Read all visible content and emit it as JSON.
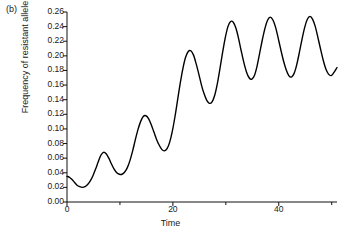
{
  "panel": {
    "label": "(b)"
  },
  "chart_data": {
    "type": "line",
    "title": "",
    "subtitle": "",
    "xlabel": "Time",
    "ylabel": "Frequency of resistant allele",
    "xlim": [
      0,
      51
    ],
    "ylim": [
      0.0,
      0.26
    ],
    "grid": false,
    "legend": null,
    "line_color": "#000000",
    "line_width": 1.4,
    "xticks": [
      0,
      20,
      40
    ],
    "xtick_labels": [
      "0",
      "20",
      "40"
    ],
    "xminor_ticks": [
      10,
      30,
      50
    ],
    "yticks": [
      0.0,
      0.02,
      0.04,
      0.06,
      0.08,
      0.1,
      0.12,
      0.14,
      0.16,
      0.18,
      0.2,
      0.22,
      0.24,
      0.26
    ],
    "ytick_labels": [
      "0.00",
      "0.02",
      "0.04",
      "0.06",
      "0.08",
      "0.10",
      "0.12",
      "0.14",
      "0.16",
      "0.18",
      "0.20",
      "0.22",
      "0.24",
      "0.26"
    ],
    "series": [
      {
        "name": "resistant allele frequency",
        "x": [
          0.0,
          0.4,
          0.9,
          1.4,
          1.9,
          2.4,
          2.9,
          3.4,
          3.9,
          4.4,
          4.9,
          5.4,
          5.9,
          6.4,
          6.9,
          7.4,
          7.9,
          8.4,
          8.9,
          9.4,
          9.9,
          10.4,
          10.9,
          11.4,
          11.9,
          12.4,
          12.9,
          13.4,
          13.9,
          14.4,
          14.9,
          15.4,
          15.9,
          16.4,
          16.9,
          17.4,
          17.9,
          18.4,
          18.9,
          19.4,
          19.9,
          20.4,
          20.9,
          21.4,
          21.9,
          22.4,
          22.9,
          23.4,
          23.9,
          24.4,
          24.9,
          25.4,
          25.9,
          26.4,
          26.9,
          27.4,
          27.9,
          28.4,
          28.9,
          29.4,
          29.9,
          30.4,
          30.9,
          31.4,
          31.9,
          32.4,
          32.9,
          33.4,
          33.9,
          34.4,
          34.9,
          35.4,
          35.9,
          36.4,
          36.9,
          37.4,
          37.9,
          38.4,
          38.9,
          39.4,
          39.9,
          40.4,
          40.9,
          41.4,
          41.9,
          42.4,
          42.9,
          43.4,
          43.9,
          44.4,
          44.9,
          45.4,
          45.9,
          46.4,
          46.9,
          47.4,
          47.9,
          48.4,
          48.9,
          49.4,
          49.9,
          50.4,
          51.0
        ],
        "y": [
          0.035,
          0.034,
          0.031,
          0.027,
          0.023,
          0.021,
          0.02,
          0.021,
          0.024,
          0.029,
          0.036,
          0.045,
          0.055,
          0.064,
          0.068,
          0.066,
          0.06,
          0.052,
          0.045,
          0.04,
          0.038,
          0.038,
          0.041,
          0.047,
          0.057,
          0.07,
          0.085,
          0.099,
          0.11,
          0.117,
          0.118,
          0.114,
          0.106,
          0.096,
          0.086,
          0.078,
          0.072,
          0.07,
          0.073,
          0.082,
          0.097,
          0.117,
          0.14,
          0.163,
          0.183,
          0.198,
          0.206,
          0.207,
          0.201,
          0.189,
          0.175,
          0.16,
          0.148,
          0.139,
          0.135,
          0.137,
          0.146,
          0.162,
          0.183,
          0.205,
          0.225,
          0.24,
          0.247,
          0.246,
          0.238,
          0.224,
          0.207,
          0.191,
          0.178,
          0.17,
          0.168,
          0.173,
          0.186,
          0.204,
          0.222,
          0.238,
          0.249,
          0.253,
          0.249,
          0.239,
          0.224,
          0.208,
          0.193,
          0.181,
          0.173,
          0.171,
          0.176,
          0.188,
          0.205,
          0.223,
          0.239,
          0.25,
          0.254,
          0.25,
          0.24,
          0.225,
          0.209,
          0.194,
          0.182,
          0.175,
          0.173,
          0.177,
          0.184
        ]
      }
    ]
  }
}
